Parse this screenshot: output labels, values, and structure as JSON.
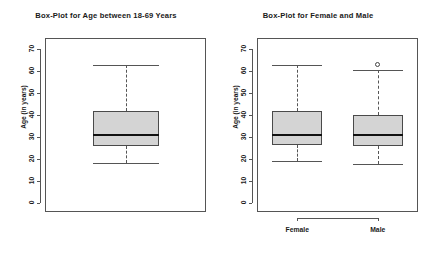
{
  "figure": {
    "width": 424,
    "height": 260,
    "background": "#ffffff",
    "box_fill": "#d4d4d4",
    "line_color": "#555555",
    "median_color": "#111111"
  },
  "chart_data": [
    {
      "type": "box",
      "panel": "left",
      "title": "Box-Plot for Age between 18-69 Years",
      "xlabel": "",
      "ylabel": "Age (in years)",
      "ylim": [
        0,
        73
      ],
      "yticks": [
        0,
        10,
        20,
        30,
        40,
        50,
        60,
        70
      ],
      "ytick_labels": [
        "0",
        "10",
        "20",
        "30",
        "40",
        "50",
        "60",
        "70"
      ],
      "grid": false,
      "legend": "none",
      "categories": [
        ""
      ],
      "boxes": [
        {
          "name": "All",
          "whisker_low": 18,
          "q1": 26,
          "median": 31,
          "q3": 41.5,
          "whisker_high": 62.5,
          "outliers": []
        }
      ]
    },
    {
      "type": "box",
      "panel": "right",
      "title": "Box-Plot for Female and Male",
      "xlabel": "",
      "ylabel": "Age (in years)",
      "ylim": [
        0,
        73
      ],
      "yticks": [
        0,
        10,
        20,
        30,
        40,
        50,
        60,
        70
      ],
      "ytick_labels": [
        "0",
        "10",
        "20",
        "30",
        "40",
        "50",
        "60",
        "70"
      ],
      "grid": false,
      "legend": "none",
      "categories": [
        "Female",
        "Male"
      ],
      "boxes": [
        {
          "name": "Female",
          "whisker_low": 19,
          "q1": 26.5,
          "median": 31,
          "q3": 41.5,
          "whisker_high": 62.5,
          "outliers": []
        },
        {
          "name": "Male",
          "whisker_low": 17.5,
          "q1": 26,
          "median": 31,
          "q3": 40,
          "whisker_high": 60.5,
          "outliers": [
            63
          ]
        }
      ]
    }
  ]
}
